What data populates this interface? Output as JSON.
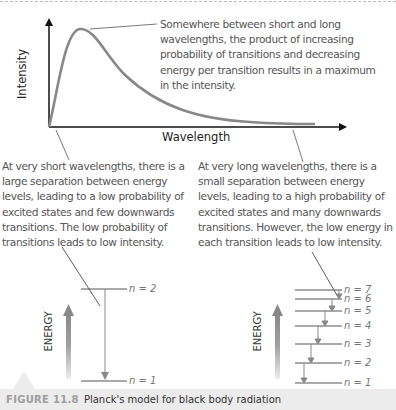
{
  "graph": {
    "y_axis_label": "Intensity",
    "x_axis_label": "Wavelength"
  },
  "annotations": {
    "peak": "Somewhere between short and long wavelengths, the product of increasing probability of transitions and decreasing energy per transition results in a maximum in the intensity.",
    "short_wavelength": "At very short wavelengths, there is a large separation between energy levels, leading to a low probability of excited states and few downwards transitions. The low probability of transitions leads to low intensity.",
    "long_wavelength": "At very long wavelengths, there is a small separation between energy levels, leading to a high probability of excited states and many downwards transitions. However, the low energy in each transition leads to low intensity."
  },
  "left_diagram": {
    "energy_label": "ENERGY",
    "levels": [
      "n = 2",
      "n = 1"
    ]
  },
  "right_diagram": {
    "energy_label": "ENERGY",
    "levels": [
      "n = 7",
      "n = 6",
      "n = 5",
      "n = 4",
      "n = 3",
      "n = 2",
      "n = 1"
    ]
  },
  "caption": {
    "label": "FIGURE 11.8",
    "text": "Planck's model for black body radiation"
  }
}
